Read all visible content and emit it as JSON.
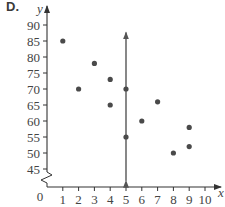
{
  "panel_label": "D.",
  "chart_data": {
    "type": "scatter",
    "title": "",
    "xlabel": "x",
    "ylabel": "y",
    "xlim": [
      0,
      10
    ],
    "ylim": [
      45,
      90
    ],
    "y_axis_break": true,
    "origin_label": "0",
    "x_ticks": [
      1,
      2,
      3,
      4,
      5,
      6,
      7,
      8,
      9,
      10
    ],
    "y_ticks": [
      45,
      50,
      55,
      60,
      65,
      70,
      75,
      80,
      85,
      90
    ],
    "grid": false,
    "legend": null,
    "points": [
      {
        "x": 1,
        "y": 85
      },
      {
        "x": 2,
        "y": 70
      },
      {
        "x": 3,
        "y": 78
      },
      {
        "x": 4,
        "y": 73
      },
      {
        "x": 4,
        "y": 65
      },
      {
        "x": 5,
        "y": 70
      },
      {
        "x": 5,
        "y": 55
      },
      {
        "x": 6,
        "y": 60
      },
      {
        "x": 7,
        "y": 66
      },
      {
        "x": 8,
        "y": 50
      },
      {
        "x": 9,
        "y": 58
      },
      {
        "x": 9,
        "y": 52
      }
    ],
    "annotations": [
      {
        "type": "vertical-line-double-arrow",
        "x": 5,
        "y_from": 41,
        "y_to": 88
      }
    ]
  },
  "colors": {
    "axis": "#444444",
    "point": "#4a4a4a",
    "line": "#555555",
    "label": "#3a3a3a"
  }
}
